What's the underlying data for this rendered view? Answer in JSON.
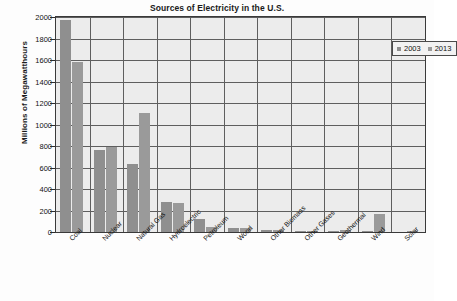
{
  "chart_data": {
    "type": "bar",
    "title": "Sources of Electricity in the U.S.",
    "xlabel": "",
    "ylabel": "Millions of Megawatthours",
    "ylim": [
      0,
      2000
    ],
    "ytick_step": 200,
    "grid": true,
    "legend_position": "top-right",
    "categories": [
      "Coal",
      "Nuclear",
      "Natural Gas",
      "Hydroelectric",
      "Petroleum",
      "Wood",
      "Other Biomass",
      "Other Gases",
      "Geothermal",
      "Wind",
      "Solar"
    ],
    "ytick_labels": [
      "0",
      "200",
      "400",
      "600",
      "800",
      "1000",
      "1200",
      "1400",
      "1600",
      "1800",
      "2000"
    ],
    "series": [
      {
        "name": "2003",
        "color": "#8f8f8f",
        "values": [
          1970,
          765,
          630,
          275,
          120,
          37,
          15,
          12,
          14,
          11,
          0
        ]
      },
      {
        "name": "2013",
        "color": "#9a9a9a",
        "values": [
          1580,
          790,
          1110,
          270,
          45,
          40,
          20,
          12,
          15,
          168,
          9
        ]
      }
    ]
  }
}
